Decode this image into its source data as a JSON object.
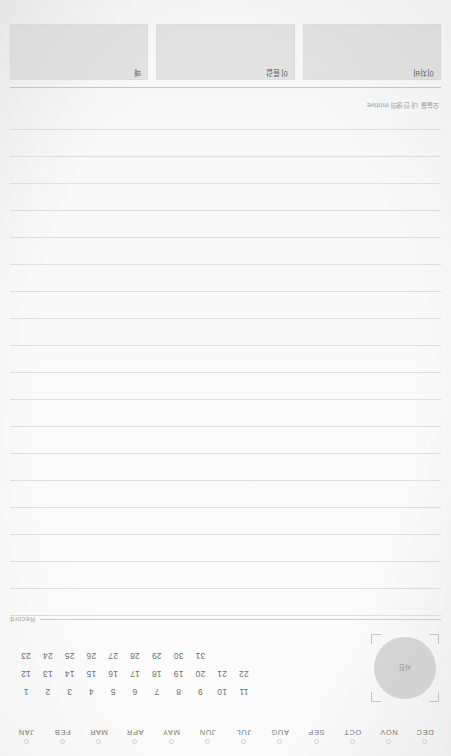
{
  "page": {
    "type": "planner-journal-page",
    "orientation": "upside-down",
    "background_color": "#fbfbfb",
    "rule_color": "#dfdfdf"
  },
  "header": {
    "boxes": [
      {
        "label": "이차비",
        "fill_color": "#e2e2e2"
      },
      {
        "label": "이름값",
        "fill_color": "#e2e2e2"
      },
      {
        "label": "왜",
        "fill_color": "#e2e2e2"
      }
    ],
    "tagline": "오늘을 내 인생의 motive"
  },
  "notes": {
    "line_count": 19,
    "line_spacing_px": 27
  },
  "record": {
    "label": "Record"
  },
  "photo": {
    "label": "사진",
    "fill_color": "#d7d7d7"
  },
  "calendar": {
    "day_rows": [
      [
        "1",
        "2",
        "3",
        "4",
        "5",
        "6",
        "7",
        "8",
        "9",
        "10",
        "11"
      ],
      [
        "12",
        "13",
        "14",
        "15",
        "16",
        "17",
        "18",
        "19",
        "20",
        "21",
        "22"
      ],
      [
        "23",
        "24",
        "25",
        "26",
        "27",
        "28",
        "29",
        "30",
        "31"
      ]
    ],
    "months": [
      "JAN",
      "FEB",
      "MAR",
      "APR",
      "MAY",
      "JUN",
      "JUL",
      "AUG",
      "SEP",
      "OCT",
      "NOV",
      "DEC"
    ]
  }
}
